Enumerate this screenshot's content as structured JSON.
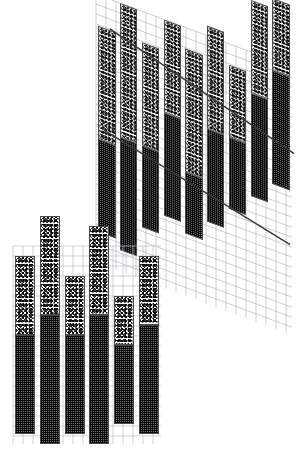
{
  "figure": {
    "title": "",
    "background_color": "#ffffff",
    "grid_color": "#b9bfc4",
    "grid_cell_px": 10,
    "bar_outline_color": "#4a4a4a",
    "dark_segment_color": "#6f6f6f",
    "stipple_segment_color": "#ffffff",
    "trendline_color": "#3a3a3a"
  },
  "chart_data": [
    {
      "id": "upper-panel",
      "type": "bar",
      "variant": "stacked",
      "orientation": "vertical",
      "projection": "sheared-perspective",
      "shear_degrees": 20.5,
      "title": "",
      "subtitle": "",
      "xlabel": "",
      "ylabel": "",
      "grid": true,
      "legend": null,
      "categories": [
        "1",
        "2",
        "3",
        "4",
        "5",
        "6",
        "7",
        "8",
        "9"
      ],
      "series": [
        {
          "name": "lower-dark",
          "texture": "crosshatch",
          "values": [
            9,
            11,
            8,
            10,
            6,
            9,
            7,
            10,
            11
          ]
        },
        {
          "name": "upper-stipple",
          "texture": "stipple",
          "values": [
            11,
            13,
            10,
            9,
            12,
            10,
            7,
            9,
            7
          ]
        }
      ],
      "baselines": [
        3,
        2,
        5,
        7,
        6,
        8,
        10,
        12,
        14
      ],
      "ylim": [
        0,
        26
      ],
      "annotations": [
        {
          "name": "upper-trendline",
          "type": "line",
          "x0": 0.05,
          "y0": 0.92,
          "x1": 0.99,
          "y1": 0.44
        },
        {
          "name": "lower-trendline",
          "type": "line",
          "x0": 0.02,
          "y0": 0.53,
          "x1": 0.97,
          "y1": 0.09
        }
      ]
    },
    {
      "id": "lower-panel",
      "type": "bar",
      "variant": "stacked",
      "orientation": "vertical",
      "projection": "orthogonal",
      "shear_degrees": 0,
      "title": "",
      "subtitle": "",
      "xlabel": "",
      "ylabel": "",
      "grid": true,
      "legend": null,
      "categories": [
        "1",
        "2",
        "3",
        "4",
        "5",
        "6"
      ],
      "series": [
        {
          "name": "lower-dark",
          "texture": "crosshatch",
          "values": [
            10,
            13,
            10,
            13,
            8,
            11
          ]
        },
        {
          "name": "upper-stipple",
          "texture": "stipple",
          "values": [
            8,
            10,
            6,
            9,
            5,
            7
          ]
        }
      ],
      "baselines": [
        1,
        0,
        1,
        0,
        2,
        1
      ],
      "ylim": [
        0,
        20
      ],
      "annotations": []
    }
  ]
}
